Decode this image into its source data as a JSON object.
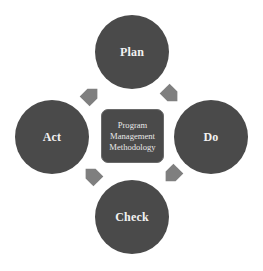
{
  "diagram": {
    "type": "cycle",
    "center": {
      "lines": [
        "Program",
        "Management",
        "Methodology"
      ]
    },
    "stages": [
      {
        "label": "Plan",
        "position": "top"
      },
      {
        "label": "Do",
        "position": "right"
      },
      {
        "label": "Check",
        "position": "bottom"
      },
      {
        "label": "Act",
        "position": "left"
      }
    ],
    "arrows": [
      {
        "from": "Plan",
        "to": "Do"
      },
      {
        "from": "Do",
        "to": "Check"
      },
      {
        "from": "Check",
        "to": "Act"
      },
      {
        "from": "Act",
        "to": "Plan"
      }
    ],
    "colors": {
      "circle_fill": "#4a4a4a",
      "arrow_fill": "#7f7f7f",
      "text": "#f2f2f2",
      "background": "#ffffff"
    }
  }
}
